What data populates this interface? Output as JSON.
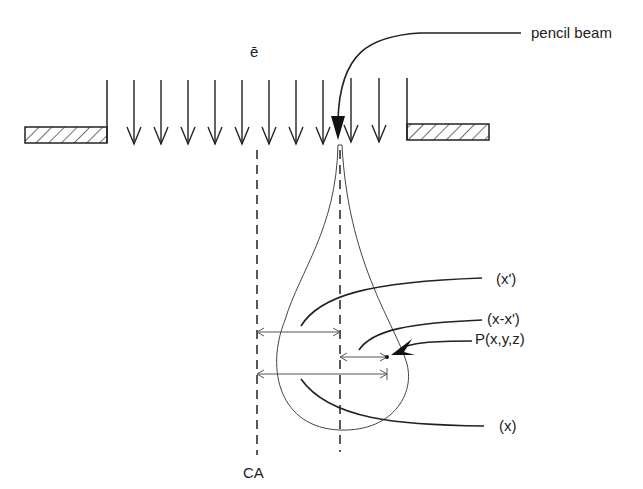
{
  "diagram": {
    "labels": {
      "electron": "ē",
      "pencil_beam": "pencil beam",
      "x_prime": "(x')",
      "x_minus_x_prime": "(x-x')",
      "point": "P(x,y,z)",
      "x": "(x)",
      "central_axis": "CA"
    },
    "beam_arrows_count": 10,
    "colors": {
      "line": "#222222",
      "thin_line": "#555555",
      "background": "#ffffff"
    }
  }
}
